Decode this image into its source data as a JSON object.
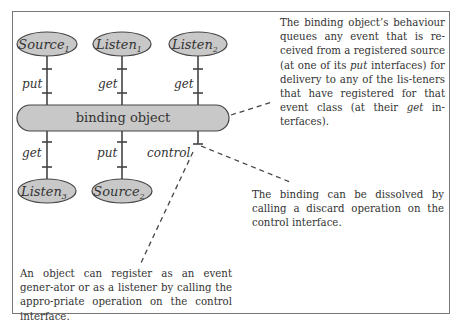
{
  "diagram": {
    "top_nodes": [
      {
        "name": "Source",
        "sub": "1",
        "interface": "put"
      },
      {
        "name": "Listen",
        "sub": "1",
        "interface": "get"
      },
      {
        "name": "Listen",
        "sub": "2",
        "interface": "get"
      }
    ],
    "bottom_nodes": [
      {
        "name": "Listen",
        "sub": "3",
        "interface": "get"
      },
      {
        "name": "Source",
        "sub": "2",
        "interface": "put"
      }
    ],
    "control_label": "control",
    "binding_label": "binding object",
    "colors": {
      "node_fill": "#c8c8c8",
      "stroke": "#444444",
      "frame": "#777777"
    }
  },
  "notes": {
    "behaviour": {
      "p1": "The binding object’s behaviour queues any event that is re-ceived from a registered source (at one of its ",
      "put": "put",
      "p2": " interfaces) for delivery to any of the lis-teners that have registered for that event class (at their ",
      "get": "get",
      "p3": " in-terfaces)."
    },
    "dissolve": "The binding can be dissolved by calling a discard operation on the control interface.",
    "register": "An object can register as an event gener-ator or as a listener by calling the appro-priate operation on the control interface."
  }
}
